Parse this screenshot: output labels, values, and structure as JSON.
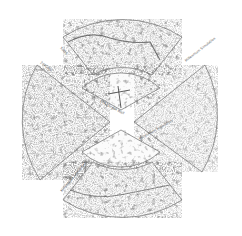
{
  "figure": {
    "panels": [
      {
        "id": "top-outer",
        "label": "SDSS",
        "sublabel": "",
        "position": "top"
      },
      {
        "id": "top-inner",
        "label": "CfA2 Great Wall",
        "sublabel": "Coma cluster",
        "position": "top-inner"
      },
      {
        "id": "left",
        "label": "2dFGRS",
        "sublabel": "",
        "position": "left"
      },
      {
        "id": "right",
        "label": "Millennium Simulation",
        "sublabel": "",
        "position": "right"
      },
      {
        "id": "bottom-inner",
        "label": "Millennium Simulation",
        "sublabel": "",
        "position": "bottom-inner"
      },
      {
        "id": "bottom-outer",
        "label": "Millennium Simulation",
        "sublabel": "",
        "position": "bottom"
      }
    ],
    "axis_labels": {
      "redshift": "z",
      "distance": "cz / 1000 km s⁻¹"
    },
    "colors": {
      "background": "#ffffff",
      "galaxies": "#333333",
      "outline": "#555555"
    }
  }
}
